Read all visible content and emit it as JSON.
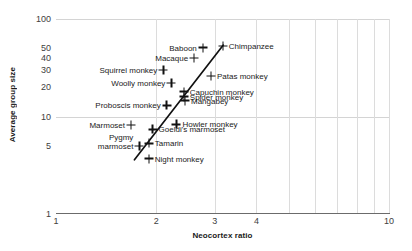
{
  "chart_data": {
    "type": "scatter",
    "title": "",
    "xlabel": "Neocortex ratio",
    "ylabel": "Average group size",
    "xscale": "log",
    "yscale": "log",
    "xlim": [
      1,
      10
    ],
    "ylim": [
      1,
      100
    ],
    "grid": true,
    "legend": "none",
    "xticks": [
      "1",
      "2",
      "3",
      "4",
      "10"
    ],
    "xtick_values": [
      1,
      2,
      3,
      4,
      10
    ],
    "yticks": [
      "1",
      "5",
      "10",
      "20",
      "30",
      "40",
      "50",
      "100"
    ],
    "ytick_values": [
      1,
      5,
      10,
      20,
      30,
      40,
      50,
      100
    ],
    "marker": "plus",
    "trendline": {
      "type": "linear-on-log-log",
      "x_start": 1.72,
      "y_start": 3.6,
      "x_end": 3.18,
      "y_end": 54
    },
    "points": [
      {
        "label": "Pygmy marmoset",
        "x": 1.78,
        "y": 5.0,
        "label_pos": "left-two-line",
        "line1": "Pygmy",
        "line2": "marmoset"
      },
      {
        "label": "Marmoset",
        "x": 1.68,
        "y": 8.2,
        "label_pos": "left"
      },
      {
        "label": "Goeldi's marmoset",
        "x": 1.95,
        "y": 7.4,
        "label_pos": "right"
      },
      {
        "label": "Tamarin",
        "x": 1.9,
        "y": 5.3,
        "label_pos": "right"
      },
      {
        "label": "Night monkey",
        "x": 1.9,
        "y": 3.7,
        "label_pos": "right"
      },
      {
        "label": "Howler monkey",
        "x": 2.3,
        "y": 8.3,
        "label_pos": "right"
      },
      {
        "label": "Proboscis monkey",
        "x": 2.15,
        "y": 13.0,
        "label_pos": "left"
      },
      {
        "label": "Woolly monkey",
        "x": 2.22,
        "y": 22.0,
        "label_pos": "left"
      },
      {
        "label": "Squirrel monkey",
        "x": 2.1,
        "y": 30.0,
        "label_pos": "left"
      },
      {
        "label": "Capuchin monkey",
        "x": 2.42,
        "y": 18.0,
        "label_pos": "right"
      },
      {
        "label": "Spider monkey",
        "x": 2.42,
        "y": 16.0,
        "label_pos": "right"
      },
      {
        "label": "Mangabey",
        "x": 2.44,
        "y": 14.5,
        "label_pos": "right"
      },
      {
        "label": "Macaque",
        "x": 2.6,
        "y": 40.0,
        "label_pos": "left"
      },
      {
        "label": "Baboon",
        "x": 2.76,
        "y": 51.0,
        "label_pos": "left"
      },
      {
        "label": "Patas monkey",
        "x": 2.92,
        "y": 26.0,
        "label_pos": "right"
      },
      {
        "label": "Chimpanzee",
        "x": 3.17,
        "y": 53.0,
        "label_pos": "right"
      }
    ]
  },
  "colors": {
    "marker": "#111111",
    "trendline": "#111111",
    "gridline": "#d4d4d4",
    "axis": "#6b6b6b",
    "text": "#1a1a1a",
    "tick_text": "#404040",
    "background": "#ffffff"
  }
}
